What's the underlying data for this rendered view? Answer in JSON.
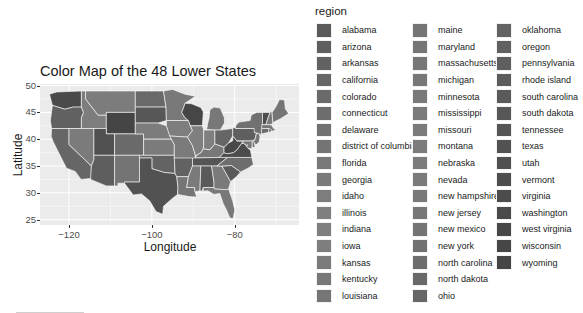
{
  "chart_data": {
    "type": "map",
    "title": "Color Map of the 48 Lower States",
    "xlabel": "Longitude",
    "ylabel": "Latitude",
    "x_ticks": [
      -120,
      -100,
      -80
    ],
    "y_ticks": [
      25,
      30,
      35,
      40,
      45,
      50
    ],
    "xlim": [
      -127,
      -64.5
    ],
    "ylim": [
      24,
      50.3
    ],
    "grid": true,
    "legend_position": "right",
    "legend": {
      "title": "region",
      "columns": [
        [
          "alabama",
          "arizona",
          "arkansas",
          "california",
          "colorado",
          "connecticut",
          "delaware",
          "district of columbia",
          "florida",
          "georgia",
          "idaho",
          "illinois",
          "indiana",
          "iowa",
          "kansas",
          "kentucky",
          "louisiana"
        ],
        [
          "maine",
          "maryland",
          "massachusetts",
          "michigan",
          "minnesota",
          "mississippi",
          "missouri",
          "montana",
          "nebraska",
          "nevada",
          "new hampshire",
          "new jersey",
          "new mexico",
          "new york",
          "north carolina",
          "north dakota",
          "ohio"
        ],
        [
          "oklahoma",
          "oregon",
          "pennsylvania",
          "rhode island",
          "south carolina",
          "south dakota",
          "tennessee",
          "texas",
          "utah",
          "vermont",
          "virginia",
          "washington",
          "west virginia",
          "wisconsin",
          "wyoming"
        ]
      ]
    },
    "region_colors": {
      "alabama": "#5a5a5a",
      "arizona": "#5e5e5e",
      "arkansas": "#626262",
      "california": "#666666",
      "colorado": "#6a6a6a",
      "connecticut": "#6d6d6d",
      "delaware": "#717171",
      "district of columbia": "#747474",
      "florida": "#787878",
      "georgia": "#7a7a7a",
      "idaho": "#7d7d7d",
      "illinois": "#7f7f7f",
      "indiana": "#7f7f7f",
      "iowa": "#7e7e7e",
      "kansas": "#7b7b7b",
      "kentucky": "#787878",
      "louisiana": "#757575",
      "maine": "#757575",
      "maryland": "#767676",
      "massachusetts": "#777777",
      "michigan": "#787878",
      "minnesota": "#797979",
      "mississippi": "#7a7a7a",
      "missouri": "#7b7b7b",
      "montana": "#7c7c7c",
      "nebraska": "#7c7c7c",
      "nevada": "#7b7b7b",
      "new hampshire": "#797979",
      "new jersey": "#777777",
      "new mexico": "#747474",
      "new york": "#717171",
      "north carolina": "#6d6d6d",
      "north dakota": "#696969",
      "ohio": "#666666",
      "oklahoma": "#636363",
      "oregon": "#616161",
      "pennsylvania": "#5f5f5f",
      "rhode island": "#5c5c5c",
      "south carolina": "#5a5a5a",
      "south dakota": "#575757",
      "tennessee": "#555555",
      "texas": "#525252",
      "utah": "#505050",
      "vermont": "#4e4e4e",
      "virginia": "#4c4c4c",
      "washington": "#4a4a4a",
      "west virginia": "#484848",
      "wisconsin": "#464646",
      "wyoming": "#454545"
    }
  }
}
